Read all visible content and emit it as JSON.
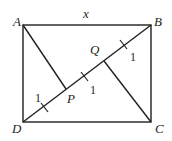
{
  "diagram": {
    "type": "geometry",
    "shape": "rectangle ABCD with diagonal DB and perpendiculars AP and CQ",
    "colors": {
      "stroke": "#231f20",
      "background": "#ffffff"
    },
    "vertices": {
      "A": {
        "label": "A",
        "x": 23,
        "y": 25
      },
      "B": {
        "label": "B",
        "x": 151,
        "y": 25
      },
      "C": {
        "label": "C",
        "x": 151,
        "y": 122
      },
      "D": {
        "label": "D",
        "x": 23,
        "y": 122
      },
      "P": {
        "label": "P",
        "x": 66,
        "y": 89
      },
      "Q": {
        "label": "Q",
        "x": 104,
        "y": 61
      }
    },
    "side_label": {
      "text": "x",
      "side": "AB"
    },
    "segment_labels": [
      {
        "text": "1",
        "segment": "DP"
      },
      {
        "text": "1",
        "segment": "PQ"
      },
      {
        "text": "1",
        "segment": "QB"
      }
    ]
  }
}
